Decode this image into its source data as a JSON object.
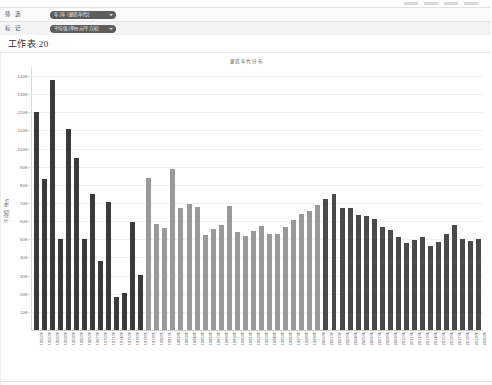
{
  "window": {
    "worksheet_title": "工作表 20"
  },
  "filters": {
    "rows": [
      {
        "label": "筛 选",
        "pill_text": "年 [年 (建造年代)]",
        "icon": "chevron-down-icon"
      },
      {
        "label": "标 记",
        "pill_text": "平均值 [单价元/平方米]",
        "icon": "chevron-down-icon"
      }
    ]
  },
  "chart_data": {
    "type": "bar",
    "title": "建造年代分布",
    "xlabel": "",
    "ylabel": "平均值 单价",
    "ylim": [
      0,
      145000
    ],
    "grid": true,
    "legend": "none",
    "y_ticks": [
      "10K",
      "20K",
      "30K",
      "40K",
      "50K",
      "60K",
      "70K",
      "80K",
      "90K",
      "100K",
      "110K",
      "120K",
      "130K",
      "140K"
    ],
    "y_tick_values": [
      10000,
      20000,
      30000,
      40000,
      50000,
      60000,
      70000,
      80000,
      90000,
      100000,
      110000,
      120000,
      130000,
      140000
    ],
    "color_groups": [
      {
        "name": "early-period",
        "color": "#3a3a3a"
      },
      {
        "name": "mid-period",
        "color": "#9a9a9a"
      },
      {
        "name": "late-period",
        "color": "#4a4a4a"
      }
    ],
    "categories": [
      "1950年",
      "1955年",
      "1956年",
      "1958年",
      "1959年",
      "1960年",
      "1965年",
      "1967年",
      "1970年",
      "1971年",
      "1974年",
      "1975年",
      "1976年",
      "1978年",
      "1979年",
      "1980年",
      "1981年",
      "1982年",
      "1983年",
      "1984年",
      "1985年",
      "1986年",
      "1987年",
      "1988年",
      "1989年",
      "1990年",
      "1991年",
      "1992年",
      "1993年",
      "1994年",
      "1995年",
      "1996年",
      "1997年",
      "1998年",
      "1999年",
      "2000年",
      "2001年",
      "2002年",
      "2003年",
      "2004年",
      "2005年",
      "2006年",
      "2007年",
      "2008年",
      "2009年",
      "2010年",
      "2011年",
      "2012年",
      "2013年",
      "2014年",
      "2015年",
      "2016年",
      "2017年",
      "2018年",
      "2019年",
      "2020年"
    ],
    "values": [
      120000,
      83000,
      138000,
      50000,
      111000,
      95000,
      50000,
      75000,
      38000,
      70500,
      18000,
      20500,
      59500,
      30500,
      84000,
      58500,
      56500,
      89000,
      67500,
      69500,
      68000,
      52500,
      55500,
      58000,
      68500,
      54000,
      52000,
      54500,
      57500,
      53000,
      53000,
      57000,
      60500,
      64000,
      65500,
      69000,
      72500,
      75000,
      67500,
      67000,
      63500,
      63000,
      61000,
      57000,
      55000,
      51500,
      48000,
      49500,
      51500,
      46500,
      48500,
      53000,
      58000,
      50000,
      49000,
      50000
    ],
    "bar_colors": [
      "#3a3a3a",
      "#3a3a3a",
      "#3a3a3a",
      "#3a3a3a",
      "#3a3a3a",
      "#3a3a3a",
      "#3a3a3a",
      "#3a3a3a",
      "#3a3a3a",
      "#3a3a3a",
      "#3a3a3a",
      "#3a3a3a",
      "#3a3a3a",
      "#3a3a3a",
      "#9a9a9a",
      "#9a9a9a",
      "#9a9a9a",
      "#9a9a9a",
      "#9a9a9a",
      "#9a9a9a",
      "#9a9a9a",
      "#9a9a9a",
      "#9a9a9a",
      "#9a9a9a",
      "#9a9a9a",
      "#9a9a9a",
      "#9a9a9a",
      "#9a9a9a",
      "#9a9a9a",
      "#9a9a9a",
      "#9a9a9a",
      "#9a9a9a",
      "#9a9a9a",
      "#9a9a9a",
      "#9a9a9a",
      "#9a9a9a",
      "#4a4a4a",
      "#4a4a4a",
      "#4a4a4a",
      "#4a4a4a",
      "#4a4a4a",
      "#4a4a4a",
      "#4a4a4a",
      "#4a4a4a",
      "#4a4a4a",
      "#4a4a4a",
      "#4a4a4a",
      "#4a4a4a",
      "#4a4a4a",
      "#4a4a4a",
      "#4a4a4a",
      "#4a4a4a",
      "#4a4a4a",
      "#4a4a4a",
      "#4a4a4a",
      "#4a4a4a"
    ]
  }
}
